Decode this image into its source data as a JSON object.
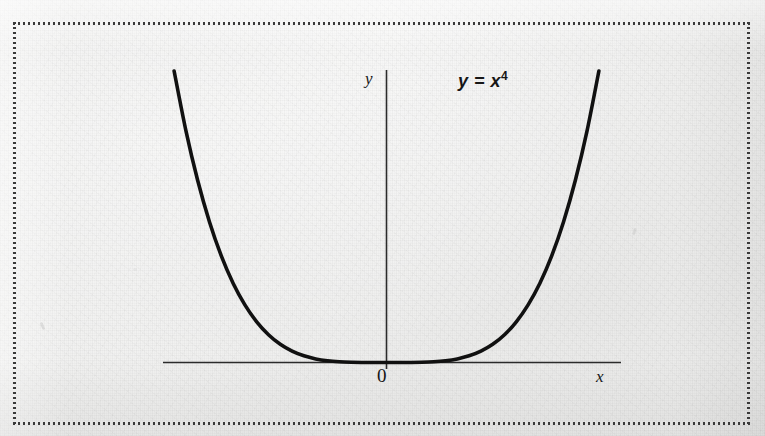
{
  "figure": {
    "caption_equation": "y = x",
    "equation_base": "y = x",
    "equation_exponent": "4",
    "background_color": "#efefee",
    "ink_color": "#111111",
    "axis_color": "#2b2b2b",
    "border_style": "dotted",
    "border_color": "#3a3a3a"
  },
  "labels": {
    "y_axis": "y",
    "x_axis": "x",
    "origin": "0",
    "equation_text": "y = x4"
  },
  "chart_data": {
    "type": "line",
    "title": "",
    "subtitle": "",
    "xlabel": "x",
    "ylabel": "y",
    "annotations": [
      {
        "text": "y = x^4",
        "x": 1.45,
        "y": 9.6
      },
      {
        "text": "0",
        "x": -0.1,
        "y": -0.55
      }
    ],
    "legend": [],
    "legend_position": "none",
    "grid": false,
    "axes": {
      "x_axis_visible": true,
      "y_axis_visible": true,
      "x_axis_drawn_range": [
        -2.05,
        1.15
      ],
      "y_axis_drawn_range": [
        -0.25,
        11.2
      ]
    },
    "xlim": [
      -1.85,
      1.78
    ],
    "ylim": [
      0,
      10.5
    ],
    "function": "y = x^4",
    "series": [
      {
        "name": "y = x^4",
        "color": "#111111",
        "linewidth": 3.6,
        "x": [
          -1.8,
          -1.7,
          -1.6,
          -1.5,
          -1.4,
          -1.3,
          -1.2,
          -1.1,
          -1.0,
          -0.9,
          -0.8,
          -0.7,
          -0.6,
          -0.5,
          -0.4,
          -0.3,
          -0.2,
          -0.1,
          0.0,
          0.1,
          0.2,
          0.3,
          0.4,
          0.5,
          0.6,
          0.7,
          0.8,
          0.9,
          1.0,
          1.1,
          1.2,
          1.3,
          1.4,
          1.5,
          1.6,
          1.7,
          1.8
        ],
        "y": [
          10.4976,
          8.3521,
          6.5536,
          5.0625,
          3.8416,
          2.8561,
          2.0736,
          1.4641,
          1.0,
          0.6561,
          0.4096,
          0.2401,
          0.1296,
          0.0625,
          0.0256,
          0.0081,
          0.0016,
          0.0001,
          0.0,
          0.0001,
          0.0016,
          0.0081,
          0.0256,
          0.0625,
          0.1296,
          0.2401,
          0.4096,
          0.6561,
          1.0,
          1.4641,
          2.0736,
          2.8561,
          3.8416,
          5.0625,
          6.5536,
          8.3521,
          10.4976
        ]
      }
    ],
    "key_points": [
      {
        "label": "vertex",
        "x": 0,
        "y": 0
      },
      {
        "label": "left-endpoint",
        "x": -1.8,
        "y": 10.4976
      },
      {
        "label": "right-endpoint",
        "x": 1.8,
        "y": 10.4976
      }
    ]
  }
}
